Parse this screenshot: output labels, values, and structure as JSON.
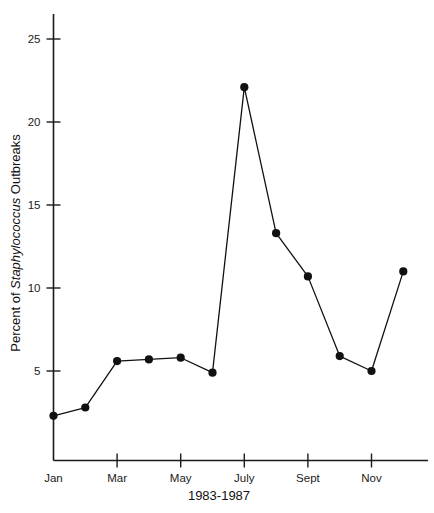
{
  "chart_data": {
    "type": "line",
    "title": "",
    "xlabel": "1983-1987",
    "ylabel_prefix": "Percent of ",
    "ylabel_italic": "Staphylococcus",
    "ylabel_suffix": " Outbreaks",
    "ylabel_full": "Percent of Staphylococcus Outbreaks",
    "categories": [
      "Jan",
      "Feb",
      "Mar",
      "Apr",
      "May",
      "June",
      "July",
      "Aug",
      "Sept",
      "Oct",
      "Nov",
      "Dec"
    ],
    "values": [
      2.3,
      2.8,
      5.6,
      5.7,
      5.8,
      4.9,
      22.1,
      13.3,
      10.7,
      5.9,
      5.0,
      11.0
    ],
    "x_tick_labels": [
      "Jan",
      "Mar",
      "May",
      "July",
      "Sept",
      "Nov"
    ],
    "x_tick_categories": [
      "Jan",
      "Mar",
      "May",
      "July",
      "Sept",
      "Nov"
    ],
    "y_tick_labels": [
      "5",
      "10",
      "15",
      "20",
      "25"
    ],
    "y_ticks": [
      5,
      10,
      15,
      20,
      25
    ],
    "ylim": [
      0,
      26.5
    ],
    "xlim": [
      0,
      12.2
    ],
    "grid": false,
    "legend": false,
    "legend_position": "none",
    "marker": "circle",
    "marker_color": "#111111",
    "line_color": "#111111",
    "axis_color": "#1a1a1a",
    "background_color": "#ffffff"
  }
}
